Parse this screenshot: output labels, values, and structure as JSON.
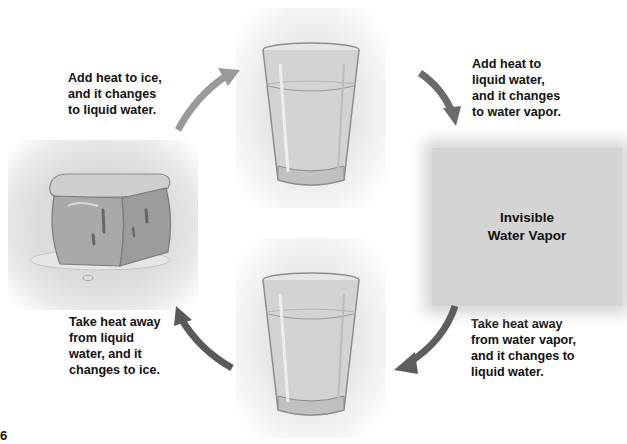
{
  "diagram": {
    "captions": {
      "top_left": "Add heat to ice,\nand it changes\nto liquid water.",
      "top_right": "Add heat to\nliquid water,\nand it changes\nto water vapor.",
      "bottom_left": "Take heat away\nfrom liquid\nwater, and it\nchanges to ice.",
      "bottom_right": "Take heat away\nfrom water vapor,\nand it changes to\nliquid water."
    },
    "vapor_label": "Invisible\nWater Vapor",
    "states": [
      {
        "name": "ice-cube",
        "position": "left"
      },
      {
        "name": "glass-of-water-top",
        "position": "top"
      },
      {
        "name": "water-vapor",
        "position": "right"
      },
      {
        "name": "glass-of-water-bottom",
        "position": "bottom"
      }
    ],
    "arrows": [
      {
        "from": "ice",
        "to": "liquid water",
        "color": "#9a9a9a"
      },
      {
        "from": "liquid water",
        "to": "water vapor",
        "color": "#6a6a6a"
      },
      {
        "from": "water vapor",
        "to": "liquid water",
        "color": "#5e5e5e"
      },
      {
        "from": "liquid water",
        "to": "ice",
        "color": "#5a5a5a"
      }
    ],
    "page_number": "6"
  }
}
